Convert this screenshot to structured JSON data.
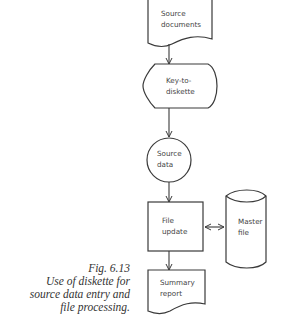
{
  "nodes": {
    "source_documents": {
      "line1": "Source",
      "line2": "documents",
      "shape": "document"
    },
    "key_to_diskette": {
      "line1": "Key-to-",
      "line2": "diskette",
      "shape": "offline-storage / display"
    },
    "source_data": {
      "line1": "Source",
      "line2": "data",
      "shape": "connector-circle"
    },
    "file_update": {
      "line1": "File",
      "line2": "update",
      "shape": "process"
    },
    "master_file": {
      "line1": "Master",
      "line2": "file",
      "shape": "disk-cylinder"
    },
    "summary_report": {
      "line1": "Summary",
      "line2": "report",
      "shape": "document"
    }
  },
  "edges": [
    {
      "from": "source_documents",
      "to": "key_to_diskette",
      "direction": "forward"
    },
    {
      "from": "key_to_diskette",
      "to": "source_data",
      "direction": "forward"
    },
    {
      "from": "source_data",
      "to": "file_update",
      "direction": "forward"
    },
    {
      "from": "file_update",
      "to": "master_file",
      "direction": "bidirectional"
    },
    {
      "from": "file_update",
      "to": "summary_report",
      "direction": "forward"
    }
  ],
  "caption": {
    "figure": "Fig. 6.13",
    "line1": "Use of diskette for",
    "line2": "source data entry and",
    "line3": "file processing."
  }
}
